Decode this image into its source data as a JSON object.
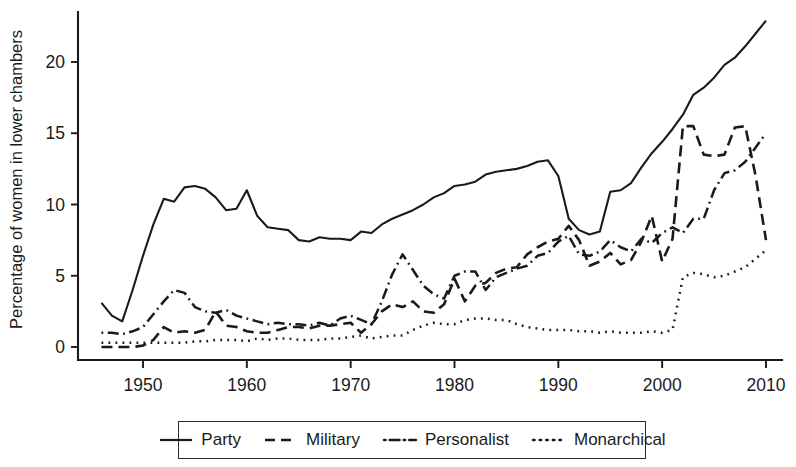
{
  "chart_data": {
    "type": "line",
    "title": "",
    "subtitle": "",
    "xlabel": "",
    "ylabel": "Percentage of women in lower chambers",
    "xlim": [
      1945,
      2011
    ],
    "ylim": [
      0,
      23.5
    ],
    "grid": false,
    "legend_position": "bottom",
    "x_ticks": [
      1950,
      1960,
      1970,
      1980,
      1990,
      2000,
      2010
    ],
    "y_ticks": [
      0,
      5,
      10,
      15,
      20
    ],
    "line_color": "#1a1a1a",
    "series": [
      {
        "name": "Party",
        "style": "solid",
        "x": [
          1946,
          1947,
          1948,
          1949,
          1950,
          1951,
          1952,
          1953,
          1954,
          1955,
          1956,
          1957,
          1958,
          1959,
          1960,
          1961,
          1962,
          1963,
          1964,
          1965,
          1966,
          1967,
          1968,
          1969,
          1970,
          1971,
          1972,
          1973,
          1974,
          1975,
          1976,
          1977,
          1978,
          1979,
          1980,
          1981,
          1982,
          1983,
          1984,
          1985,
          1986,
          1987,
          1988,
          1989,
          1990,
          1991,
          1992,
          1993,
          1994,
          1995,
          1996,
          1997,
          1998,
          1999,
          2000,
          2001,
          2002,
          2003,
          2004,
          2005,
          2006,
          2007,
          2008,
          2009,
          2010
        ],
        "values": [
          3.1,
          2.2,
          1.8,
          4.0,
          6.4,
          8.6,
          10.4,
          10.2,
          11.2,
          11.3,
          11.1,
          10.5,
          9.6,
          9.7,
          11.0,
          9.2,
          8.4,
          8.3,
          8.2,
          7.5,
          7.4,
          7.7,
          7.6,
          7.6,
          7.5,
          8.1,
          8.0,
          8.6,
          9.0,
          9.3,
          9.6,
          10.0,
          10.5,
          10.8,
          11.3,
          11.4,
          11.6,
          12.1,
          12.3,
          12.4,
          12.5,
          12.7,
          13.0,
          13.1,
          12.0,
          9.0,
          8.2,
          7.9,
          8.1,
          10.9,
          11.0,
          11.5,
          12.6,
          13.6,
          14.4,
          15.3,
          16.3,
          17.7,
          18.2,
          18.9,
          19.8,
          20.3,
          21.1,
          22.0,
          22.9
        ]
      },
      {
        "name": "Military",
        "style": "dashed",
        "x": [
          1946,
          1947,
          1948,
          1949,
          1950,
          1951,
          1952,
          1953,
          1954,
          1955,
          1956,
          1957,
          1958,
          1959,
          1960,
          1961,
          1962,
          1963,
          1964,
          1965,
          1966,
          1967,
          1968,
          1969,
          1970,
          1971,
          1972,
          1973,
          1974,
          1975,
          1976,
          1977,
          1978,
          1979,
          1980,
          1981,
          1982,
          1983,
          1984,
          1985,
          1986,
          1987,
          1988,
          1989,
          1990,
          1991,
          1992,
          1993,
          1994,
          1995,
          1996,
          1997,
          1998,
          1999,
          2000,
          2001,
          2002,
          2003,
          2004,
          2005,
          2006,
          2007,
          2008,
          2009,
          2010
        ],
        "values": [
          0.0,
          0.0,
          0.0,
          0.0,
          0.1,
          0.5,
          1.4,
          1.0,
          1.1,
          1.0,
          1.2,
          2.5,
          1.5,
          1.4,
          1.1,
          1.0,
          1.0,
          1.2,
          1.4,
          1.4,
          1.3,
          1.5,
          1.5,
          1.6,
          1.7,
          1.0,
          1.6,
          2.5,
          3.0,
          2.8,
          3.2,
          2.5,
          2.4,
          3.0,
          4.8,
          3.2,
          4.3,
          4.5,
          5.2,
          5.5,
          5.6,
          6.5,
          7.0,
          7.4,
          7.6,
          8.5,
          7.5,
          5.7,
          6.0,
          6.6,
          5.8,
          6.1,
          7.4,
          9.2,
          6.0,
          7.6,
          15.5,
          15.5,
          13.5,
          13.4,
          13.5,
          15.4,
          15.5,
          12.0,
          7.5
        ]
      },
      {
        "name": "Personalist",
        "style": "dashdot",
        "x": [
          1946,
          1947,
          1948,
          1949,
          1950,
          1951,
          1952,
          1953,
          1954,
          1955,
          1956,
          1957,
          1958,
          1959,
          1960,
          1961,
          1962,
          1963,
          1964,
          1965,
          1966,
          1967,
          1968,
          1969,
          1970,
          1971,
          1972,
          1973,
          1974,
          1975,
          1976,
          1977,
          1978,
          1979,
          1980,
          1981,
          1982,
          1983,
          1984,
          1985,
          1986,
          1987,
          1988,
          1989,
          1990,
          1991,
          1992,
          1993,
          1994,
          1995,
          1996,
          1997,
          1998,
          1999,
          2000,
          2001,
          2002,
          2003,
          2004,
          2005,
          2006,
          2007,
          2008,
          2009,
          2010
        ],
        "values": [
          1.0,
          1.0,
          0.9,
          1.1,
          1.4,
          2.3,
          3.2,
          4.0,
          3.8,
          2.8,
          2.5,
          2.4,
          2.6,
          2.2,
          2.0,
          1.8,
          1.6,
          1.7,
          1.6,
          1.6,
          1.5,
          1.7,
          1.5,
          2.0,
          2.2,
          1.9,
          1.6,
          3.2,
          5.1,
          6.5,
          5.4,
          4.3,
          3.7,
          3.4,
          5.0,
          5.3,
          5.3,
          4.0,
          4.9,
          5.2,
          5.5,
          5.7,
          6.4,
          6.6,
          7.4,
          7.8,
          6.5,
          6.4,
          6.7,
          7.5,
          7.0,
          6.7,
          7.6,
          7.3,
          8.0,
          8.4,
          8.0,
          9.0,
          9.0,
          11.0,
          12.2,
          12.4,
          13.0,
          14.0,
          15.0
        ]
      },
      {
        "name": "Monarchical",
        "style": "dotted",
        "x": [
          1946,
          1947,
          1948,
          1949,
          1950,
          1951,
          1952,
          1953,
          1954,
          1955,
          1956,
          1957,
          1958,
          1959,
          1960,
          1961,
          1962,
          1963,
          1964,
          1965,
          1966,
          1967,
          1968,
          1969,
          1970,
          1971,
          1972,
          1973,
          1974,
          1975,
          1976,
          1977,
          1978,
          1979,
          1980,
          1981,
          1982,
          1983,
          1984,
          1985,
          1986,
          1987,
          1988,
          1989,
          1990,
          1991,
          1992,
          1993,
          1994,
          1995,
          1996,
          1997,
          1998,
          1999,
          2000,
          2001,
          2002,
          2003,
          2004,
          2005,
          2006,
          2007,
          2008,
          2009,
          2010
        ],
        "values": [
          0.3,
          0.3,
          0.3,
          0.3,
          0.3,
          0.3,
          0.3,
          0.3,
          0.3,
          0.4,
          0.4,
          0.5,
          0.5,
          0.5,
          0.4,
          0.6,
          0.5,
          0.6,
          0.6,
          0.5,
          0.5,
          0.5,
          0.6,
          0.6,
          0.7,
          0.8,
          0.6,
          0.7,
          0.8,
          0.8,
          1.2,
          1.5,
          1.7,
          1.6,
          1.6,
          1.9,
          2.0,
          2.0,
          1.9,
          1.9,
          1.6,
          1.4,
          1.3,
          1.2,
          1.2,
          1.2,
          1.1,
          1.1,
          1.0,
          1.1,
          1.0,
          1.0,
          1.0,
          1.1,
          1.0,
          1.2,
          4.9,
          5.2,
          5.1,
          4.9,
          5.0,
          5.3,
          5.6,
          6.2,
          6.8
        ]
      }
    ]
  },
  "legend": {
    "items": [
      {
        "label": "Party",
        "style": "solid"
      },
      {
        "label": "Military",
        "style": "dashed"
      },
      {
        "label": "Personalist",
        "style": "dashdot"
      },
      {
        "label": "Monarchical",
        "style": "dotted"
      }
    ]
  }
}
